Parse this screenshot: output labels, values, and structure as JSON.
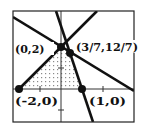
{
  "diagram": {
    "type": "feasible-region-graph",
    "frame": {
      "x": 13,
      "y": 11,
      "width": 121,
      "height": 111
    },
    "origin_px": {
      "x": 61,
      "y": 89
    },
    "unit_px": 21,
    "colors": {
      "line": "#111111",
      "frame": "#222222",
      "axis": "#333333",
      "dots": "#8a8a8a",
      "background": "#ffffff"
    },
    "lines": [
      {
        "name": "y = x + 2",
        "points": [
          [
            -2,
            0
          ],
          [
            1.71,
            3.71
          ]
        ]
      },
      {
        "name": "y = -2/3 x + 2",
        "points": [
          [
            -2.29,
            3.52
          ],
          [
            3.48,
            -0.1
          ]
        ]
      },
      {
        "name": "y = -3x + 3",
        "points": [
          [
            -0.24,
            3.71
          ],
          [
            1.52,
            -1.57
          ]
        ]
      }
    ],
    "region_vertices": [
      [
        -2,
        0
      ],
      [
        0,
        2
      ],
      [
        0.4286,
        1.7143
      ],
      [
        1,
        0
      ]
    ],
    "points": [
      {
        "label": "(0,2)",
        "x": 0,
        "y": 2
      },
      {
        "label": "(3/7,12/7)",
        "x": 0.4286,
        "y": 1.7143
      },
      {
        "label": "(-2,0)",
        "x": -2,
        "y": 0
      },
      {
        "label": "(1,0)",
        "x": 1,
        "y": 0
      }
    ],
    "ticks": {
      "x": [
        -1,
        2
      ],
      "y": [
        1,
        -1
      ]
    }
  }
}
